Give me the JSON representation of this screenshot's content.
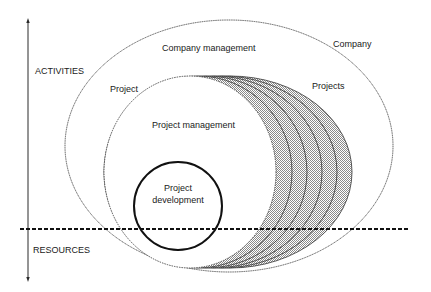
{
  "axis": {
    "top_label": "ACTIVITIES",
    "bottom_label": "RESOURCES"
  },
  "regions": {
    "company": {
      "label": "Company"
    },
    "company_management": {
      "label": "Company management"
    },
    "project": {
      "label": "Project"
    },
    "projects": {
      "label": "Projects"
    },
    "project_management": {
      "label": "Project management"
    },
    "project_development": {
      "line1": "Project",
      "line2": "development"
    }
  },
  "colors": {
    "stroke": "#2a2a2a",
    "hatch": "#b8b8b8",
    "background": "#ffffff"
  },
  "crescent_count": 5
}
